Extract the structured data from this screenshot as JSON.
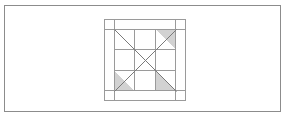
{
  "figure": {
    "background_color": "#ffffff",
    "frame": {
      "name": "outer-rectangle-frame",
      "x": 4,
      "y": 5,
      "width": 277,
      "height": 107,
      "stroke_color": "#8c8c8c",
      "stroke_width": 1,
      "fill_color": "#ffffff"
    },
    "block": {
      "name": "quilt-block",
      "x": 104,
      "y": 19,
      "width": 82,
      "height": 82,
      "stroke_color": "#9a9a9a",
      "stroke_width": 1,
      "fill_color": "#ffffff",
      "sashing_inset": 10,
      "inner": {
        "x": 114,
        "y": 29,
        "width": 62,
        "height": 62,
        "grid_rows": 3,
        "grid_cols": 3,
        "cell_size": 20.667
      }
    },
    "shaded_color": "#d2d2d2",
    "line_color": "#7a7a7a",
    "grid_color": "#9a9a9a",
    "shaded_triangles": [
      {
        "name": "triangle-top-right",
        "points": "155.33,29 176,29 176,49.67",
        "fill": "#d2d2d2"
      },
      {
        "name": "triangle-bottom-left",
        "points": "114,70.33 134.67,91 114,91",
        "fill": "#d2d2d2"
      },
      {
        "name": "triangle-bottom-right",
        "points": "155.33,70.33 155.33,91 176,91",
        "fill": "#d2d2d2"
      }
    ],
    "diagonals": [
      {
        "name": "diagonal-top-left-to-bottom-right",
        "x1": 114,
        "y1": 29,
        "x2": 176,
        "y2": 91
      },
      {
        "name": "diagonal-top-right-to-bottom-left",
        "x1": 176,
        "y1": 29,
        "x2": 114,
        "y2": 91
      }
    ],
    "vertical_grid_lines": [
      {
        "name": "vline-1",
        "x": 134.67
      },
      {
        "name": "vline-2",
        "x": 155.33
      }
    ],
    "horizontal_grid_lines": [
      {
        "name": "hline-1",
        "y": 49.67
      },
      {
        "name": "hline-2",
        "y": 70.33
      }
    ],
    "sashing_lines": [
      {
        "name": "sash-left-vertical",
        "orientation": "vertical",
        "pos": 114
      },
      {
        "name": "sash-right-vertical",
        "orientation": "vertical",
        "pos": 176
      },
      {
        "name": "sash-top-horizontal",
        "orientation": "horizontal",
        "pos": 29
      },
      {
        "name": "sash-bottom-horizontal",
        "orientation": "horizontal",
        "pos": 91
      }
    ]
  }
}
